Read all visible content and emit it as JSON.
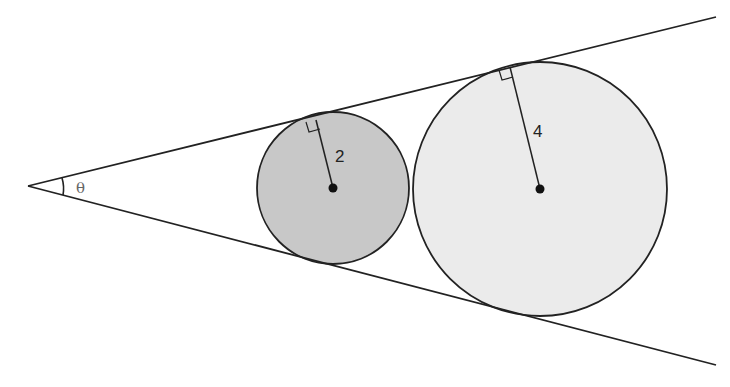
{
  "diagram": {
    "title": "",
    "angle_label": "θ",
    "small_circle": {
      "radius_label": "2",
      "fill": "#c8c8c8",
      "center": [
        333,
        188
      ],
      "r": 76,
      "tangent_point": [
        313,
        122
      ]
    },
    "large_circle": {
      "radius_label": "4",
      "fill": "#ebebeb",
      "center": [
        540,
        189
      ],
      "r": 127,
      "tangent_point": [
        505,
        69
      ]
    },
    "vertex": [
      28,
      186
    ],
    "upper_ray_end": [
      716,
      17
    ],
    "lower_ray_end": [
      716,
      365
    ],
    "stroke_color": "#222222"
  }
}
